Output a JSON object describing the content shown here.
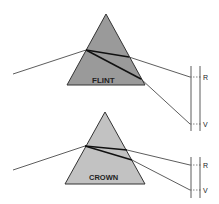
{
  "diagram": {
    "prisms": [
      {
        "name": "flint",
        "label": "FLINT",
        "fill": "#9a9a9a"
      },
      {
        "name": "crown",
        "label": "CROWN",
        "fill": "#c2c2c2"
      }
    ],
    "screen_labels": {
      "flint_red": "R",
      "flint_violet": "V",
      "crown_red": "R",
      "crown_violet": "V"
    }
  }
}
